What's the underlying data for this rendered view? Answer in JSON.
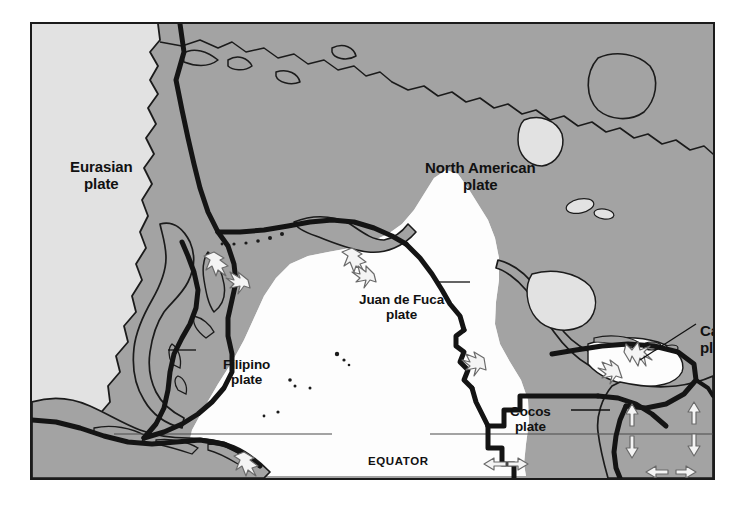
{
  "figure": {
    "type": "map",
    "frame": {
      "border_color": "#1b1b1b",
      "x": 30,
      "y": 22,
      "width": 685,
      "height": 458
    }
  },
  "colors": {
    "page_background": "#ffffff",
    "ocean_light_gray": "#e2e2e2",
    "land_gray": "#a3a3a3",
    "pacific_white": "#fdfdfd",
    "outline_black": "#1b1b1b",
    "boundary_black": "#141414",
    "arrow_fill": "#f2f2f2",
    "arrow_stroke": "#666666",
    "text": "#111111"
  },
  "labels": {
    "eurasian": {
      "line1": "Eurasian",
      "line2": "plate"
    },
    "north_american": {
      "line1": "North American",
      "line2": "plate"
    },
    "juan_de_fuca": {
      "line1": "Juan de Fuca",
      "line2": "plate"
    },
    "filipino": {
      "line1": "Filipino",
      "line2": "plate"
    },
    "cocos": {
      "line1": "Cocos",
      "line2": "plate"
    },
    "caribbean": {
      "line1": "Carib",
      "line2": "pla"
    },
    "equator": "EQUATOR"
  },
  "plates": [
    "Eurasian plate",
    "North American plate",
    "Juan de Fuca plate",
    "Filipino plate",
    "Cocos plate",
    "Caribbean plate"
  ],
  "annotations": {
    "leader_lines": [
      {
        "label": "Juan de Fuca plate",
        "from": "label-right",
        "to": "plate-body"
      },
      {
        "label": "Filipino plate",
        "from": "label-left",
        "to": "plate-body"
      },
      {
        "label": "Cocos plate",
        "from": "label-right",
        "to": "plate-body"
      },
      {
        "label": "Caribbean plate",
        "from": "label-bottom-left",
        "to": "plate-body"
      }
    ],
    "boundary_markers": [
      {
        "kind": "convergent-arrows",
        "description": "white arrows pointing toward each other",
        "location": "Kuril-Japan trench"
      },
      {
        "kind": "convergent-arrows",
        "description": "white arrows pointing toward each other",
        "location": "Aleutian trench"
      },
      {
        "kind": "convergent-arrows",
        "description": "white arrows pointing toward each other",
        "location": "Cascadia margin"
      },
      {
        "kind": "convergent-arrows",
        "description": "white arrows pointing toward each other",
        "location": "Greater Antilles"
      },
      {
        "kind": "divergent-arrows",
        "description": "white arrows pointing apart, vertical",
        "location": "Cocos-Nazca spreading center"
      },
      {
        "kind": "divergent-arrows",
        "description": "white arrows pointing apart, horizontal",
        "location": "East Pacific Rise"
      },
      {
        "kind": "divergent-arrows",
        "description": "white arrows pointing apart, horizontal",
        "location": "Galapagos rift"
      },
      {
        "kind": "convergent-arrows",
        "description": "white arrows pointing toward each other",
        "location": "Java trench"
      }
    ],
    "equator_line": {
      "style": "thin horizontal rule broken by label",
      "y_fraction": 0.9
    }
  }
}
